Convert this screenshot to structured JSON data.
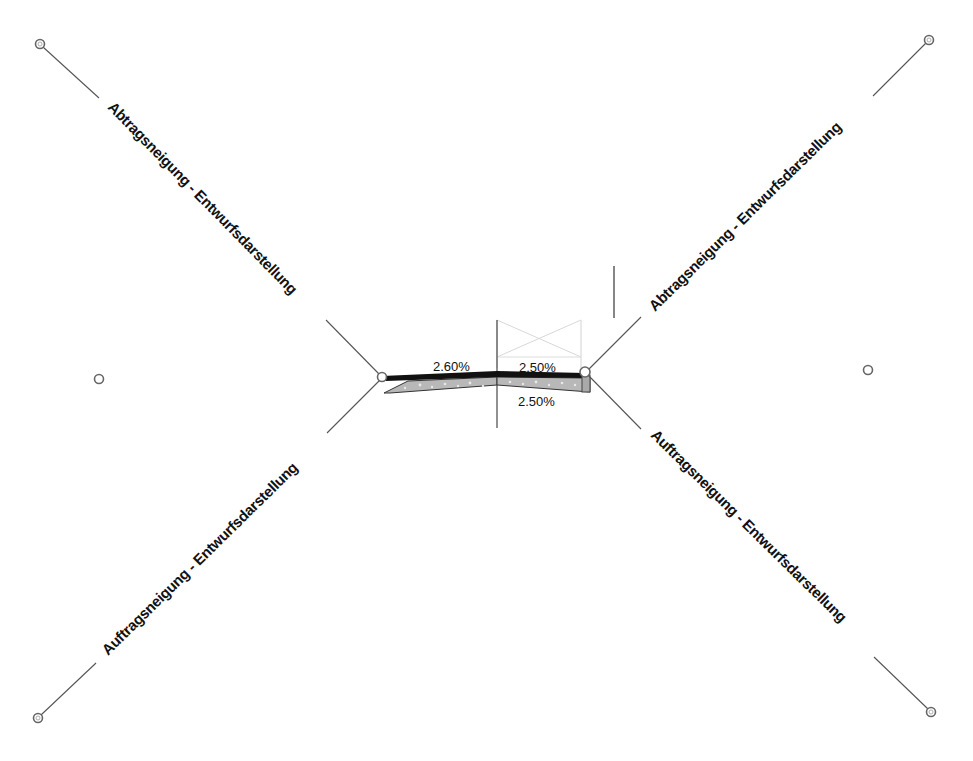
{
  "drawing": {
    "type": "assembly-cross-section",
    "colors": {
      "background": "#ffffff",
      "line": "#555555",
      "text": "#111111",
      "pavement_fill": "#b5b5b5",
      "pavement_top": "#111111",
      "construction_lines": "#cfcfcf"
    },
    "subassemblies": {
      "top_left": {
        "label": "Abtragsneigung - Entwurfsdarstellung",
        "kind": "cut-slope"
      },
      "top_right": {
        "label": "Abtragsneigung - Entwurfsdarstellung",
        "kind": "cut-slope"
      },
      "bottom_left": {
        "label": "Auftragsneigung - Entwurfsdarstellung",
        "kind": "fill-slope"
      },
      "bottom_right": {
        "label": "Auftragsneigung - Entwurfsdarstellung",
        "kind": "fill-slope"
      }
    },
    "lane_grades": {
      "left_top": "2.60%",
      "right_top": "2.50%",
      "right_bottom": "2.50%"
    },
    "grips": [
      {
        "name": "grip-top-left",
        "x": 40,
        "y": 44
      },
      {
        "name": "grip-top-right",
        "x": 929,
        "y": 40
      },
      {
        "name": "grip-bottom-left",
        "x": 38,
        "y": 718
      },
      {
        "name": "grip-bottom-right",
        "x": 931,
        "y": 712
      },
      {
        "name": "grip-side-left",
        "x": 99,
        "y": 379
      },
      {
        "name": "grip-side-right",
        "x": 868,
        "y": 370
      },
      {
        "name": "grip-hinge-left",
        "x": 382,
        "y": 377
      },
      {
        "name": "grip-hinge-right",
        "x": 585,
        "y": 372
      }
    ]
  }
}
